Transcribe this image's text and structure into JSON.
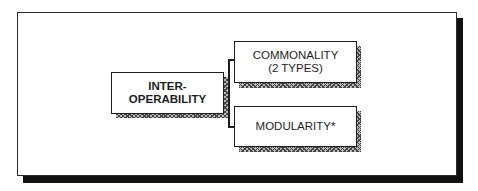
{
  "diagram": {
    "type": "hierarchy",
    "root": {
      "id": "interoperability",
      "label_lines": [
        "INTER-",
        "OPERABILITY"
      ],
      "bold": true
    },
    "children": [
      {
        "id": "commonality",
        "label_lines": [
          "COMMONALITY",
          "(2 TYPES)"
        ],
        "bold": false
      },
      {
        "id": "modularity",
        "label_lines": [
          "MODULARITY*"
        ],
        "bold": false
      }
    ],
    "connector": "bracket",
    "colors": {
      "line": "#1e1e1e",
      "frame_shadow": "#111111",
      "box_fill": "#ffffff"
    }
  }
}
